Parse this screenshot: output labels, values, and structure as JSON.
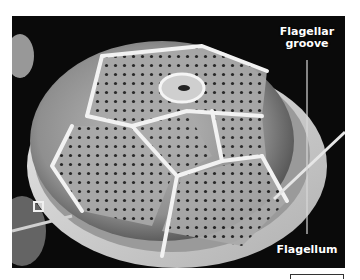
{
  "figure": {
    "labels": {
      "flagellar_groove": "Flagellar groove",
      "flagellar_groove_line1": "Flagellar",
      "flagellar_groove_line2": "groove",
      "flagellum": "Flagellum"
    },
    "scale_bar": {
      "visible": true,
      "value_label": ""
    },
    "colors": {
      "background": "#0a0a0a",
      "label_text": "#ffffff",
      "plates": "#d8d8d8",
      "sutures": "#f4f4f4"
    }
  }
}
